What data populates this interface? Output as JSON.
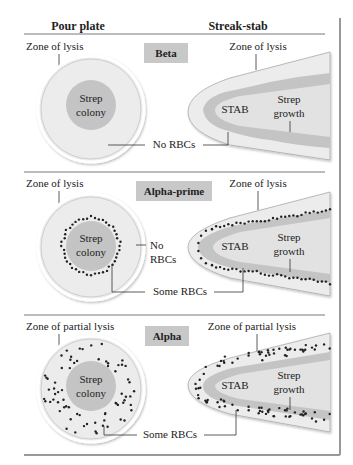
{
  "headers": {
    "left": "Pour plate",
    "right": "Streak-stab"
  },
  "colors": {
    "zone": "#ececec",
    "colony": "#c4c4c4",
    "label_box": "#c8c8c8",
    "line": "#333333",
    "frame": "#888888"
  },
  "panels": [
    {
      "type": "Beta",
      "plate_zone_label": "Zone of lysis",
      "stab_zone_label": "Zone of lysis",
      "colony_line1": "Strep",
      "colony_line2": "colony",
      "stab_label": "STAB",
      "growth_line1": "Strep",
      "growth_line2": "growth",
      "rbc_label": "No RBCs"
    },
    {
      "type": "Alpha-prime",
      "plate_zone_label": "Zone of lysis",
      "stab_zone_label": "Zone of lysis",
      "colony_line1": "Strep",
      "colony_line2": "colony",
      "stab_label": "STAB",
      "growth_line1": "Strep",
      "growth_line2": "growth",
      "no_rbc_line1": "No",
      "no_rbc_line2": "RBCs",
      "rbc_label": "Some RBCs"
    },
    {
      "type": "Alpha",
      "plate_zone_label": "Zone of partial lysis",
      "stab_zone_label": "Zone of partial lysis",
      "colony_line1": "Strep",
      "colony_line2": "colony",
      "stab_label": "STAB",
      "growth_line1": "Strep",
      "growth_line2": "growth",
      "rbc_label": "Some RBCs"
    }
  ]
}
